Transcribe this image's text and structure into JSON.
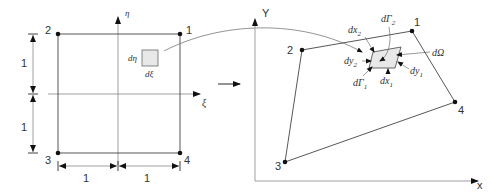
{
  "colors": {
    "line": "#555555",
    "axis": "#888888",
    "node": "#111111",
    "text": "#333333",
    "element_fill": "#e8e8e8",
    "background": "#ffffff"
  },
  "reference_element": {
    "axes": {
      "eta": "η",
      "xi": "ξ"
    },
    "nodes": [
      {
        "id": "1",
        "label": "1"
      },
      {
        "id": "2",
        "label": "2"
      },
      {
        "id": "3",
        "label": "3"
      },
      {
        "id": "4",
        "label": "4"
      }
    ],
    "dimensions": {
      "vertical_top": "1",
      "vertical_bottom": "1",
      "horizontal_left": "1",
      "horizontal_right": "1"
    },
    "differential": {
      "d_eta": "dη",
      "d_xi": "dξ"
    }
  },
  "physical_element": {
    "axes": {
      "x": "x",
      "y": "Y"
    },
    "nodes": [
      {
        "id": "1",
        "label": "1"
      },
      {
        "id": "2",
        "label": "2"
      },
      {
        "id": "3",
        "label": "3"
      },
      {
        "id": "4",
        "label": "4"
      }
    ],
    "differential": {
      "dx2": "dx",
      "dx2_sub": "2",
      "dGamma2": "dΓ",
      "dGamma2_sub": "2",
      "dy2": "dy",
      "dy2_sub": "2",
      "dy1": "dy",
      "dy1_sub": "1",
      "dGamma1": "dΓ",
      "dGamma1_sub": "1",
      "dx1": "dx",
      "dx1_sub": "1",
      "dOmega": "dΩ"
    }
  },
  "mapping_arrow": {
    "label": ""
  }
}
